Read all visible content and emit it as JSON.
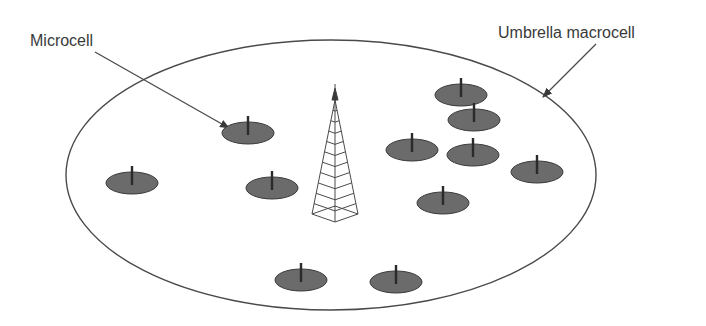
{
  "labels": {
    "microcell": "Microcell",
    "macrocell": "Umbrella macrocell"
  },
  "colors": {
    "background": "#ffffff",
    "outline": "#4a4a4a",
    "microcell_fill": "#6b6b6b",
    "text": "#3a3a3a"
  },
  "macrocell": {
    "cx": 331,
    "cy": 175,
    "rx": 265,
    "ry": 135
  },
  "tower": {
    "x": 335,
    "top": 88,
    "base": 222,
    "half_width": 23
  },
  "microcells": [
    {
      "x": 248,
      "y": 133
    },
    {
      "x": 132,
      "y": 183
    },
    {
      "x": 272,
      "y": 188
    },
    {
      "x": 461,
      "y": 95
    },
    {
      "x": 474,
      "y": 120
    },
    {
      "x": 412,
      "y": 150
    },
    {
      "x": 473,
      "y": 155
    },
    {
      "x": 537,
      "y": 172
    },
    {
      "x": 443,
      "y": 203
    },
    {
      "x": 301,
      "y": 280
    },
    {
      "x": 396,
      "y": 282
    }
  ]
}
